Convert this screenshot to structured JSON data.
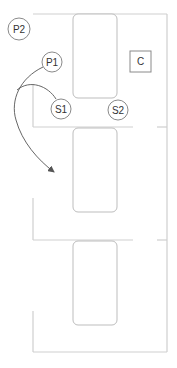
{
  "diagram": {
    "type": "floor-plan",
    "nodes": [
      {
        "id": "P2",
        "label": "P2",
        "shape": "circle",
        "cx": 19,
        "cy": 29,
        "r": 11
      },
      {
        "id": "P1",
        "label": "P1",
        "shape": "circle",
        "cx": 52,
        "cy": 62,
        "r": 10
      },
      {
        "id": "S1",
        "label": "S1",
        "shape": "circle",
        "cx": 61,
        "cy": 109,
        "r": 10
      },
      {
        "id": "S2",
        "label": "S2",
        "shape": "circle",
        "cx": 118,
        "cy": 110,
        "r": 10
      },
      {
        "id": "C",
        "label": "C",
        "shape": "square",
        "x": 130,
        "y": 51,
        "w": 21,
        "h": 21
      }
    ],
    "tables": [
      {
        "x": 73,
        "y": 14,
        "w": 44,
        "h": 84
      },
      {
        "x": 73,
        "y": 127,
        "w": 44,
        "h": 85
      },
      {
        "x": 73,
        "y": 241,
        "w": 44,
        "h": 84
      }
    ],
    "edges": [
      {
        "from": "P1",
        "to": "room-2",
        "style": "arrow"
      },
      {
        "from": "S1",
        "to": "room-2",
        "style": "arrow"
      }
    ],
    "colors": {
      "wall": "#cfcfcf",
      "table": "#bdbdbd",
      "node_stroke": "#8a8a8a",
      "arrow": "#555555",
      "text": "#333333"
    }
  },
  "labels": {
    "p2": "P2",
    "p1": "P1",
    "s1": "S1",
    "s2": "S2",
    "c": "C"
  }
}
